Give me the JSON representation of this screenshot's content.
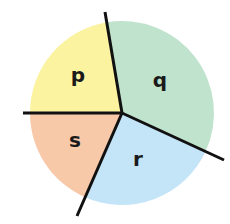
{
  "chart_data": {
    "type": "pie",
    "title": "",
    "center": [
      122,
      113
    ],
    "radius": 92,
    "slices": [
      {
        "label": "p",
        "start_deg": 180,
        "end_deg": 260.5,
        "percent": 22.4,
        "color": "#fbf3a0",
        "label_pos": [
          78,
          75
        ]
      },
      {
        "label": "q",
        "start_deg": 260.5,
        "end_deg": 384.7,
        "percent": 34.5,
        "color": "#bfe3cd",
        "label_pos": [
          160,
          80
        ]
      },
      {
        "label": "r",
        "start_deg": 24.7,
        "end_deg": 113.8,
        "percent": 24.8,
        "color": "#c4e4f7",
        "label_pos": [
          138,
          159
        ]
      },
      {
        "label": "s",
        "start_deg": 113.8,
        "end_deg": 180,
        "percent": 18.4,
        "color": "#f8c9a9",
        "label_pos": [
          75,
          140
        ]
      }
    ],
    "dividers": [
      {
        "name": "top",
        "to": [
          105,
          12
        ]
      },
      {
        "name": "left",
        "to": [
          23,
          113
        ]
      },
      {
        "name": "right",
        "to": [
          224,
          160
        ]
      },
      {
        "name": "bottom",
        "to": [
          77,
          216
        ]
      }
    ],
    "legend": null
  }
}
